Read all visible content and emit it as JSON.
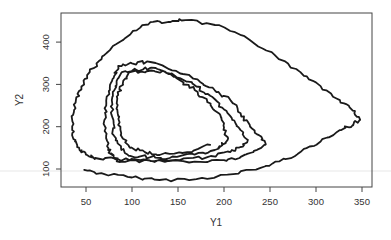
{
  "chart_data": {
    "type": "line",
    "title": "",
    "xlabel": "Y1",
    "ylabel": "Y2",
    "xlim": [
      33,
      362
    ],
    "ylim": [
      60,
      470
    ],
    "grid": false,
    "legend": null,
    "x_ticks": [
      50,
      100,
      150,
      200,
      250,
      300,
      350
    ],
    "y_ticks": [
      100,
      200,
      300,
      400
    ],
    "x_tick_labels": [
      "50",
      "100",
      "150",
      "200",
      "250",
      "300",
      "350"
    ],
    "y_tick_labels": [
      "100",
      "200",
      "300",
      "400"
    ],
    "line_color": "#1a1a1a",
    "series": [
      {
        "name": "trajectory",
        "points": [
          [
            48,
            98
          ],
          [
            70,
            88
          ],
          [
            100,
            80
          ],
          [
            130,
            74
          ],
          [
            170,
            76
          ],
          [
            210,
            88
          ],
          [
            239,
            102
          ],
          [
            260,
            118
          ],
          [
            283,
            140
          ],
          [
            305,
            165
          ],
          [
            326,
            192
          ],
          [
            340,
            204
          ],
          [
            348,
            216
          ],
          [
            340,
            238
          ],
          [
            326,
            263
          ],
          [
            305,
            296
          ],
          [
            283,
            329
          ],
          [
            255,
            370
          ],
          [
            228,
            405
          ],
          [
            195,
            440
          ],
          [
            158,
            452
          ],
          [
            140,
            448
          ],
          [
            120,
            447
          ],
          [
            98,
            418
          ],
          [
            76,
            381
          ],
          [
            64,
            355
          ],
          [
            54,
            329
          ],
          [
            45,
            295
          ],
          [
            39,
            263
          ],
          [
            36,
            228
          ],
          [
            35,
            192
          ],
          [
            38,
            165
          ],
          [
            43,
            145
          ],
          [
            50,
            134
          ],
          [
            60,
            126
          ],
          [
            85,
            123
          ],
          [
            109,
            121
          ],
          [
            140,
            119
          ],
          [
            174,
            117
          ],
          [
            200,
            121
          ],
          [
            217,
            126
          ],
          [
            232,
            140
          ],
          [
            245,
            157
          ],
          [
            238,
            180
          ],
          [
            228,
            204
          ],
          [
            218,
            232
          ],
          [
            207,
            263
          ],
          [
            190,
            286
          ],
          [
            174,
            306
          ],
          [
            148,
            332
          ],
          [
            120,
            353
          ],
          [
            100,
            350
          ],
          [
            85,
            344
          ],
          [
            80,
            315
          ],
          [
            76,
            287
          ],
          [
            72,
            250
          ],
          [
            70,
            216
          ],
          [
            72,
            180
          ],
          [
            74,
            145
          ],
          [
            80,
            128
          ],
          [
            87,
            117
          ],
          [
            120,
            119
          ],
          [
            152,
            121
          ],
          [
            182,
            128
          ],
          [
            207,
            140
          ],
          [
            218,
            152
          ],
          [
            226,
            169
          ],
          [
            218,
            192
          ],
          [
            209,
            216
          ],
          [
            198,
            245
          ],
          [
            185,
            273
          ],
          [
            170,
            295
          ],
          [
            152,
            315
          ],
          [
            136,
            330
          ],
          [
            120,
            339
          ],
          [
            104,
            335
          ],
          [
            89,
            329
          ],
          [
            82,
            296
          ],
          [
            78,
            263
          ],
          [
            79,
            220
          ],
          [
            80,
            180
          ],
          [
            88,
            150
          ],
          [
            98,
            131
          ],
          [
            120,
            128
          ],
          [
            141,
            126
          ],
          [
            168,
            134
          ],
          [
            190,
            145
          ],
          [
            198,
            156
          ],
          [
            204,
            169
          ],
          [
            200,
            198
          ],
          [
            196,
            228
          ],
          [
            182,
            258
          ],
          [
            168,
            287
          ],
          [
            152,
            310
          ],
          [
            136,
            329
          ],
          [
            116,
            331
          ],
          [
            98,
            329
          ],
          [
            90,
            302
          ],
          [
            85,
            275
          ],
          [
            84,
            240
          ],
          [
            85,
            204
          ],
          [
            90,
            172
          ],
          [
            98,
            150
          ],
          [
            114,
            140
          ],
          [
            130,
            133
          ],
          [
            160,
            140
          ],
          [
            185,
            157
          ]
        ]
      }
    ]
  },
  "axes": {
    "x_title": "Y1",
    "y_title": "Y2"
  }
}
